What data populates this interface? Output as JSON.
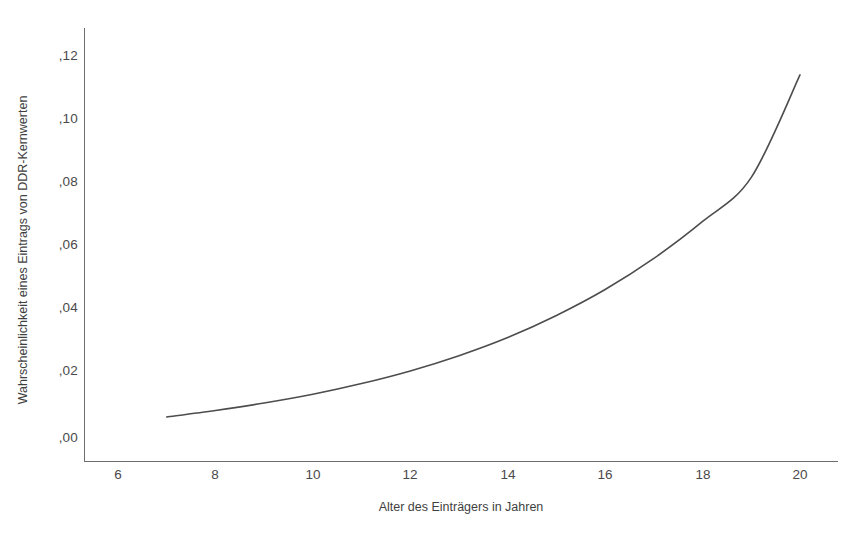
{
  "chart_data": {
    "type": "line",
    "title": "",
    "subtitle": "",
    "xlabel": "Alter des Einträgers in Jahren",
    "ylabel": "Wahrscheinlichkeit eines Eintrags von DDR-Kernwerten",
    "xlim": [
      5.3,
      20.5
    ],
    "ylim": [
      -0.004,
      0.1305
    ],
    "xticks": [
      6,
      8,
      10,
      12,
      14,
      16,
      18,
      20
    ],
    "xticklabels": [
      "6",
      "8",
      "10",
      "12",
      "14",
      "16",
      "18",
      "20"
    ],
    "yticks": [
      0.0,
      0.02,
      0.04,
      0.06,
      0.08,
      0.1,
      0.12
    ],
    "yticklabels": [
      ",00",
      ",02",
      ",04",
      ",06",
      ",08",
      ",10",
      ",12"
    ],
    "grid": false,
    "legend": null,
    "legend_position": "none",
    "line_color": "#4d4d4d",
    "line_width": 1.6,
    "series": [
      {
        "name": "Wahrscheinlichkeit eines Eintrags von DDR-Kernwerten",
        "x": [
          7,
          8,
          9,
          10,
          11,
          12,
          13,
          14,
          15,
          16,
          17,
          18,
          19,
          20
        ],
        "values": [
          0.0065,
          0.0085,
          0.0108,
          0.0135,
          0.0168,
          0.0207,
          0.0254,
          0.031,
          0.0378,
          0.0458,
          0.0554,
          0.0668,
          0.0804,
          0.112
        ]
      }
    ],
    "annotations": []
  },
  "axis": {
    "x_title": "Alter des Einträgers in Jahren",
    "y_title": "Wahrscheinlichkeit eines Eintrags von DDR-Kernwerten",
    "x_tick_labels": [
      "6",
      "8",
      "10",
      "12",
      "14",
      "16",
      "18",
      "20"
    ],
    "y_tick_labels": [
      ",12",
      ",10",
      ",08",
      ",06",
      ",04",
      ",02",
      ",00"
    ]
  },
  "colors": {
    "background": "#ffffff",
    "axis": "#6e6e6e",
    "curve": "#4d4d4d",
    "text": "#3f3f3f"
  }
}
